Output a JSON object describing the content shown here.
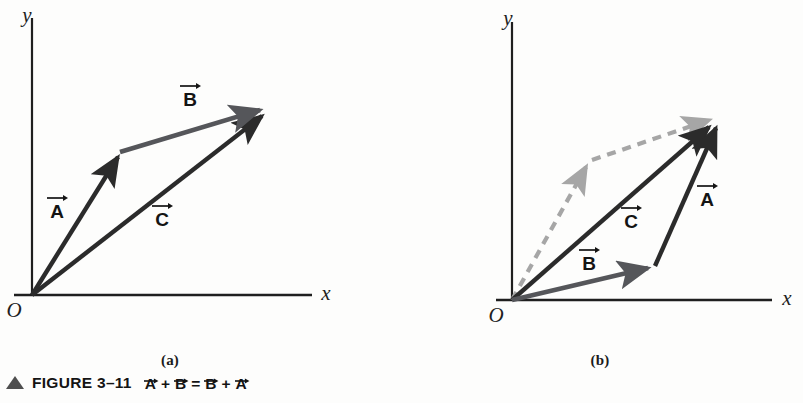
{
  "figure": {
    "number": "FIGURE 3-11",
    "caption_prefix": "FIGURE 3–11",
    "caption_equation": "A + B = B + A",
    "caption_terms": [
      "A",
      "B",
      "B",
      "A"
    ],
    "caption_ops": [
      "+",
      "=",
      "+"
    ],
    "triangle_marker": "up-triangle",
    "triangle_color": "#4f4f4f"
  },
  "panels": [
    {
      "id": "a",
      "label": "(a)",
      "axes": {
        "x_label": "x",
        "y_label": "y",
        "origin_label": "O"
      },
      "vectors": [
        {
          "name": "A",
          "label": "A",
          "style": "solid",
          "color": "#2b2b2b",
          "from": [
            32,
            295
          ],
          "to": [
            120,
            152
          ],
          "label_pos": [
            57,
            210
          ]
        },
        {
          "name": "B",
          "label": "B",
          "style": "solid",
          "color": "#55565a",
          "from": [
            120,
            152
          ],
          "to": [
            268,
            108
          ],
          "label_pos": [
            190,
            99
          ]
        },
        {
          "name": "C",
          "label": "C",
          "style": "solid",
          "color": "#2b2b2b",
          "from": [
            32,
            295
          ],
          "to": [
            270,
            110
          ],
          "label_pos": [
            162,
            218
          ]
        }
      ]
    },
    {
      "id": "b",
      "label": "(b)",
      "axes": {
        "x_label": "x",
        "y_label": "y",
        "origin_label": "O"
      },
      "vectors": [
        {
          "name": "B",
          "label": "B",
          "style": "solid",
          "color": "#55565a",
          "from": [
            512,
            300
          ],
          "to": [
            655,
            266
          ],
          "label_pos": [
            589,
            262
          ]
        },
        {
          "name": "A",
          "label": "A",
          "style": "solid",
          "color": "#2b2b2b",
          "from": [
            655,
            266
          ],
          "to": [
            718,
            119
          ],
          "label_pos": [
            706,
            198
          ]
        },
        {
          "name": "C",
          "label": "C",
          "style": "solid",
          "color": "#2b2b2b",
          "from": [
            512,
            300
          ],
          "to": [
            716,
            121
          ],
          "label_pos": [
            630,
            220
          ]
        },
        {
          "name": "A-ghost",
          "label": "",
          "style": "dashed",
          "color": "#a6a6a6",
          "from": [
            512,
            300
          ],
          "to": [
            590,
            160
          ],
          "label_pos": null
        },
        {
          "name": "B-ghost",
          "label": "",
          "style": "dashed",
          "color": "#a6a6a6",
          "from": [
            590,
            160
          ],
          "to": [
            714,
            117
          ],
          "label_pos": null
        }
      ]
    }
  ],
  "colors": {
    "background": "#fdfdfc",
    "axis": "#1f1f1f",
    "vector_dark": "#2b2b2b",
    "vector_gray": "#55565a",
    "vector_ghost": "#a6a6a6",
    "text": "#141414"
  }
}
